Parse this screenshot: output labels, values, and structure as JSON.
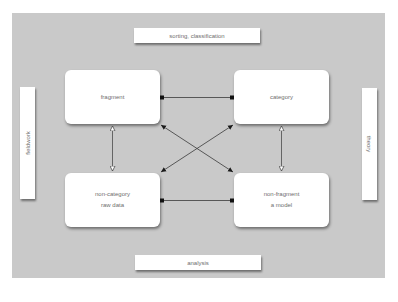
{
  "diagram": {
    "colors": {
      "panel_background": "#c9c9c9",
      "box_fill": "#ffffff",
      "text": "#6e6e6e",
      "connector": "#3a3a3a"
    },
    "labels": {
      "top": "sorting, classification",
      "bottom": "analysis",
      "left": "fieldwork",
      "right": "theory"
    },
    "nodes": {
      "top_left": {
        "lines": [
          "fragment"
        ]
      },
      "top_right": {
        "lines": [
          "category"
        ]
      },
      "bottom_left": {
        "lines": [
          "non-category",
          "raw data"
        ]
      },
      "bottom_right": {
        "lines": [
          "non-fragment",
          "a model"
        ]
      }
    },
    "connections": [
      {
        "from": "fragment",
        "to": "category",
        "style": "line with square endpoints"
      },
      {
        "from": "non-category raw data",
        "to": "non-fragment a model",
        "style": "line with square endpoints"
      },
      {
        "from": "fragment",
        "to": "non-category raw data",
        "style": "double-headed open arrow"
      },
      {
        "from": "category",
        "to": "non-fragment a model",
        "style": "double-headed open arrow"
      },
      {
        "from": "fragment",
        "to": "non-fragment a model",
        "style": "double-headed filled arrow (diagonal)"
      },
      {
        "from": "category",
        "to": "non-category raw data",
        "style": "double-headed filled arrow (diagonal)"
      }
    ]
  }
}
